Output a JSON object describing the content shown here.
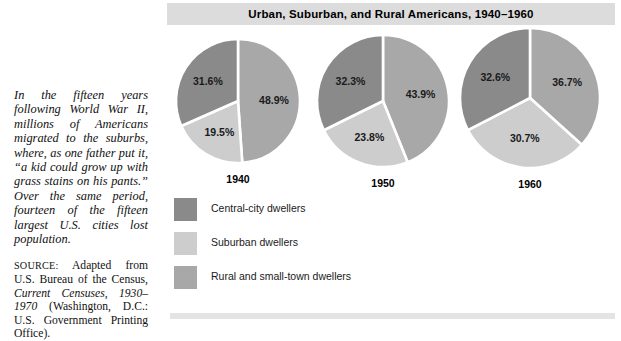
{
  "figure": {
    "title": "Urban, Suburban, and Rural Americans, 1940–1960",
    "caption": "In the fifteen years following World War II, millions of Americans migrated to the suburbs, where, as one father put it, “a kid could grow up with grass stains on his pants.” Over the same period, fourteen of the fifteen largest U.S. cities lost population.",
    "source_label": "SOURCE:",
    "source_part1": " Adapted from U.S. Bureau of the Census, ",
    "source_italic": "Current Censuses, 1930–1970",
    "source_part2": " (Washington, D.C.: U.S. Government Printing Office)."
  },
  "colors": {
    "central_city": "#8a8a8a",
    "suburban": "#cdcdcd",
    "rural": "#a8a8a8",
    "title_band": "#dcdcdc",
    "bottom_band": "#e4e4e4",
    "slice_divider": "#ffffff"
  },
  "legend": {
    "items": [
      {
        "label": "Central-city dwellers",
        "color_key": "central_city",
        "swatch_color": "#8a8a8a"
      },
      {
        "label": "Suburban dwellers",
        "color_key": "suburban",
        "swatch_color": "#cdcdcd"
      },
      {
        "label": "Rural and small-town dwellers",
        "color_key": "rural",
        "swatch_color": "#a8a8a8"
      }
    ]
  },
  "chart_data": {
    "type": "pie",
    "title": "Urban, Suburban, and Rural Americans, 1940–1960",
    "unit": "percent of U.S. population",
    "legend_position": "bottom-left",
    "grid": false,
    "series_names": [
      "Central-city dwellers",
      "Suburban dwellers",
      "Rural and small-town dwellers"
    ],
    "charts": [
      {
        "year": "1940",
        "slices": [
          {
            "category": "Rural and small-town dwellers",
            "value": 48.9,
            "label": "48.9%",
            "color": "#a8a8a8"
          },
          {
            "category": "Suburban dwellers",
            "value": 19.5,
            "label": "19.5%",
            "color": "#cdcdcd"
          },
          {
            "category": "Central-city dwellers",
            "value": 31.6,
            "label": "31.6%",
            "color": "#8a8a8a"
          }
        ]
      },
      {
        "year": "1950",
        "slices": [
          {
            "category": "Rural and small-town dwellers",
            "value": 43.9,
            "label": "43.9%",
            "color": "#a8a8a8"
          },
          {
            "category": "Suburban dwellers",
            "value": 23.8,
            "label": "23.8%",
            "color": "#cdcdcd"
          },
          {
            "category": "Central-city dwellers",
            "value": 32.3,
            "label": "32.3%",
            "color": "#8a8a8a"
          }
        ]
      },
      {
        "year": "1960",
        "slices": [
          {
            "category": "Rural and small-town dwellers",
            "value": 36.7,
            "label": "36.7%",
            "color": "#a8a8a8"
          },
          {
            "category": "Suburban dwellers",
            "value": 30.7,
            "label": "30.7%",
            "color": "#cdcdcd"
          },
          {
            "category": "Central-city dwellers",
            "value": 32.6,
            "label": "32.6%",
            "color": "#8a8a8a"
          }
        ]
      }
    ]
  }
}
